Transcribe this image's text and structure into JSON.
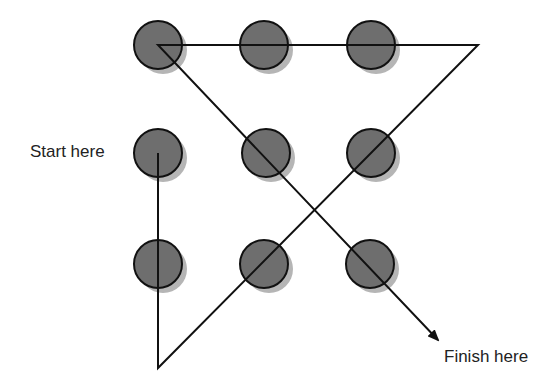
{
  "diagram": {
    "labels": {
      "start": "Start here",
      "finish": "Finish here"
    },
    "colors": {
      "dot_fill": "#6e6e6e",
      "dot_shadow": "#b5b5b5",
      "stroke": "#111111"
    },
    "dots": [
      {
        "row": 0,
        "col": 0,
        "cx": 158,
        "cy": 45
      },
      {
        "row": 0,
        "col": 1,
        "cx": 264,
        "cy": 45
      },
      {
        "row": 0,
        "col": 2,
        "cx": 371,
        "cy": 45
      },
      {
        "row": 1,
        "col": 0,
        "cx": 158,
        "cy": 153
      },
      {
        "row": 1,
        "col": 1,
        "cx": 266,
        "cy": 153
      },
      {
        "row": 1,
        "col": 2,
        "cx": 371,
        "cy": 153
      },
      {
        "row": 2,
        "col": 0,
        "cx": 158,
        "cy": 264
      },
      {
        "row": 2,
        "col": 1,
        "cx": 264,
        "cy": 264
      },
      {
        "row": 2,
        "col": 2,
        "cx": 370,
        "cy": 264
      }
    ],
    "path": [
      [
        158,
        153
      ],
      [
        158,
        368
      ],
      [
        478,
        45
      ],
      [
        158,
        45
      ],
      [
        438,
        340
      ]
    ]
  }
}
